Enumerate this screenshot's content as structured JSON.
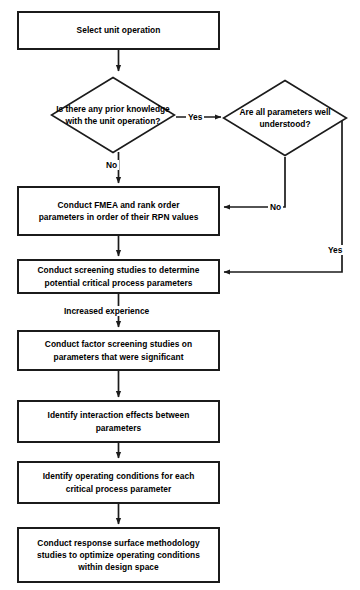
{
  "diagram": {
    "stroke_color": "#1b1b1b",
    "background_color": "#ffffff",
    "text_color": "#000000"
  },
  "nodes": {
    "select_unit_operation": {
      "type": "process",
      "label": "Select unit operation"
    },
    "prior_knowledge_decision": {
      "type": "decision",
      "line1": "Is there any prior",
      "line2": "knowledge with the unit",
      "line3": "operation?"
    },
    "parameters_understood_decision": {
      "type": "decision",
      "line1": "Are all parameters",
      "line2": "well understood?"
    },
    "fmea": {
      "type": "process",
      "line1": "Conduct FMEA and rank order",
      "line2": "parameters in order of their RPN values"
    },
    "screening_studies": {
      "type": "process",
      "line1": "Conduct screening studies to determine",
      "line2": "potential critical process parameters"
    },
    "factor_screening": {
      "type": "process",
      "line1": "Conduct factor screening studies on",
      "line2": "parameters that were significant"
    },
    "interaction_effects": {
      "type": "process",
      "line1": "Identify interaction effects between",
      "line2": "parameters"
    },
    "operating_conditions": {
      "type": "process",
      "line1": "Identify operating conditions for each",
      "line2": "critical process parameter"
    },
    "response_surface": {
      "type": "process",
      "line1": "Conduct response surface methodology",
      "line2": "studies to optimize operating conditions",
      "line3": "within design space"
    }
  },
  "edge_labels": {
    "prior_knowledge_yes": "Yes",
    "prior_knowledge_no": "No",
    "parameters_no": "No",
    "parameters_yes": "Yes",
    "increased_experience": "Increased experience"
  }
}
